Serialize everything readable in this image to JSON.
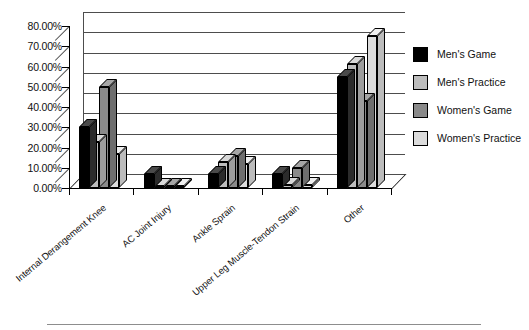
{
  "chart_data": {
    "type": "bar",
    "title": "",
    "xlabel": "",
    "ylabel": "",
    "ylim": [
      0,
      80
    ],
    "ytick_labels": [
      "0.00%",
      "10.00%",
      "20.00%",
      "30.00%",
      "40.00%",
      "50.00%",
      "60.00%",
      "70.00%",
      "80.00%"
    ],
    "ytick_values": [
      0,
      10,
      20,
      30,
      40,
      50,
      60,
      70,
      80
    ],
    "grid": true,
    "legend_position": "right",
    "categories": [
      "Internal Derangement Knee",
      "AC Joint Injury",
      "Ankle Sprain",
      "Upper Leg Muscle-Tendon Strain",
      "Other"
    ],
    "series": [
      {
        "name": "Men's Game",
        "color": "#000000",
        "values": [
          30.0,
          7.0,
          7.0,
          7.0,
          55.0
        ]
      },
      {
        "name": "Men's Practice",
        "color": "#bdbdbd",
        "values": [
          22.5,
          1.0,
          13.0,
          1.5,
          61.0
        ]
      },
      {
        "name": "Women's Game",
        "color": "#8a8a8a",
        "values": [
          50.0,
          1.0,
          16.0,
          10.0,
          43.0
        ]
      },
      {
        "name": "Women's Practice",
        "color": "#dcdcdc",
        "values": [
          17.0,
          1.0,
          12.0,
          1.5,
          75.0
        ]
      }
    ]
  },
  "legend": {
    "items": [
      {
        "label": "Men's Game"
      },
      {
        "label": "Men's Practice"
      },
      {
        "label": "Women's Game"
      },
      {
        "label": "Women's Practice"
      }
    ]
  }
}
